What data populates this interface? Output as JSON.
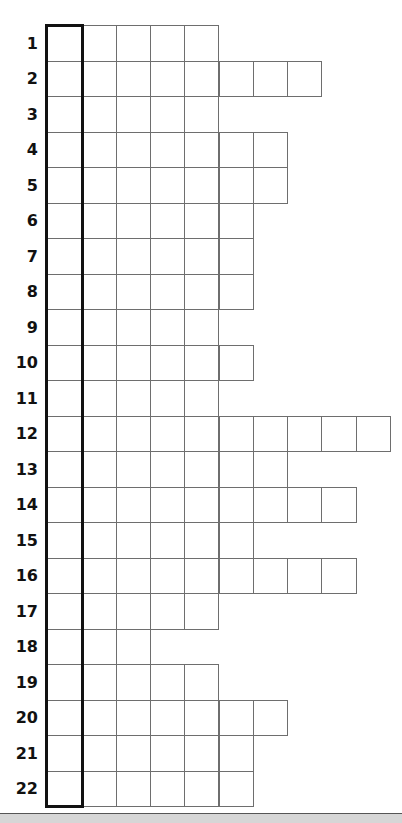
{
  "puzzle": {
    "type": "crossword-column-grid",
    "rows": [
      {
        "label": "1",
        "cells": 5
      },
      {
        "label": "2",
        "cells": 8
      },
      {
        "label": "3",
        "cells": 5
      },
      {
        "label": "4",
        "cells": 7
      },
      {
        "label": "5",
        "cells": 7
      },
      {
        "label": "6",
        "cells": 6
      },
      {
        "label": "7",
        "cells": 6
      },
      {
        "label": "8",
        "cells": 6
      },
      {
        "label": "9",
        "cells": 5
      },
      {
        "label": "10",
        "cells": 6
      },
      {
        "label": "11",
        "cells": 5
      },
      {
        "label": "12",
        "cells": 10
      },
      {
        "label": "13",
        "cells": 7
      },
      {
        "label": "14",
        "cells": 9
      },
      {
        "label": "15",
        "cells": 6
      },
      {
        "label": "16",
        "cells": 9
      },
      {
        "label": "17",
        "cells": 5
      },
      {
        "label": "18",
        "cells": 3
      },
      {
        "label": "19",
        "cells": 5
      },
      {
        "label": "20",
        "cells": 7
      },
      {
        "label": "21",
        "cells": 6
      },
      {
        "label": "22",
        "cells": 6
      }
    ],
    "highlighted_column": 1
  },
  "colors": {
    "cell_border": "#6e6e6e",
    "highlight_border": "#111111",
    "label": "#111111",
    "bottom_bar": "#d6d6d6"
  }
}
